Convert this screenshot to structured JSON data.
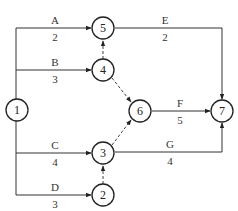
{
  "diagram": {
    "type": "activity-on-arrow network",
    "nodes": [
      {
        "id": "1",
        "label": "1",
        "x": 17,
        "y": 110
      },
      {
        "id": "2",
        "label": "2",
        "x": 103,
        "y": 195
      },
      {
        "id": "3",
        "label": "3",
        "x": 103,
        "y": 153
      },
      {
        "id": "4",
        "label": "4",
        "x": 103,
        "y": 70
      },
      {
        "id": "5",
        "label": "5",
        "x": 103,
        "y": 28
      },
      {
        "id": "6",
        "label": "6",
        "x": 140,
        "y": 111
      },
      {
        "id": "7",
        "label": "7",
        "x": 222,
        "y": 111
      }
    ],
    "activities": [
      {
        "name": "A",
        "duration": "2",
        "from": "1",
        "to": "5"
      },
      {
        "name": "B",
        "duration": "3",
        "from": "1",
        "to": "4"
      },
      {
        "name": "C",
        "duration": "4",
        "from": "1",
        "to": "3"
      },
      {
        "name": "D",
        "duration": "3",
        "from": "1",
        "to": "2"
      },
      {
        "name": "E",
        "duration": "2",
        "from": "5",
        "to": "7"
      },
      {
        "name": "F",
        "duration": "5",
        "from": "6",
        "to": "7"
      },
      {
        "name": "G",
        "duration": "4",
        "from": "3",
        "to": "7"
      }
    ],
    "dummy_activities": [
      {
        "from": "4",
        "to": "5"
      },
      {
        "from": "4",
        "to": "6"
      },
      {
        "from": "3",
        "to": "6"
      },
      {
        "from": "2",
        "to": "3"
      }
    ]
  }
}
